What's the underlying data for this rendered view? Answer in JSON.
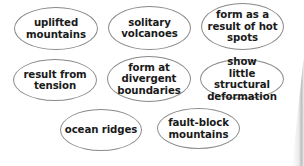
{
  "diagram": {
    "type": "concept-bubbles",
    "bubbles": [
      {
        "id": "uplifted-mountains",
        "label": "uplifted\nmountains"
      },
      {
        "id": "solitary-volcanoes",
        "label": "solitary\nvolcanoes"
      },
      {
        "id": "hot-spots",
        "label": "form as a\nresult of hot\nspots"
      },
      {
        "id": "result-from-tension",
        "label": "result from\ntension"
      },
      {
        "id": "divergent-boundaries",
        "label": "form at\ndivergent\nboundaries"
      },
      {
        "id": "little-deformation",
        "label": "show\nlittle structural\ndeformation"
      },
      {
        "id": "ocean-ridges",
        "label": "ocean ridges"
      },
      {
        "id": "fault-block-mountains",
        "label": "fault-block\nmountains"
      }
    ],
    "colors": {
      "border": "#8a8a8a",
      "text": "#1a1a1a",
      "background": "#ffffff"
    }
  }
}
